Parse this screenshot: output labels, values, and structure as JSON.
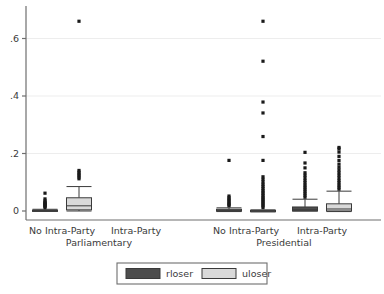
{
  "chart_data": {
    "type": "box",
    "title": "",
    "xlabel": "",
    "ylabel": "",
    "ylim": [
      -0.02,
      0.69
    ],
    "yticks": [
      0,
      0.2,
      0.4,
      0.6
    ],
    "ytick_labels": [
      "0",
      ".2",
      ".4",
      ".6"
    ],
    "grid": true,
    "grid_axis": "y",
    "legend": {
      "position": "bottom-center",
      "entries": [
        {
          "name": "rloser",
          "color": "#4d4d4d"
        },
        {
          "name": "uloser",
          "color": "#d9d9d9"
        }
      ]
    },
    "group_labels": [
      "Parliamentary",
      "Presidential"
    ],
    "categories": [
      "No Intra-Party",
      "Intra-Party",
      "No Intra-Party",
      "Intra-Party"
    ],
    "groups": [
      {
        "group": "Parliamentary",
        "category": "No Intra-Party",
        "boxes": [
          {
            "series": "rloser",
            "present": true,
            "min": 0.0,
            "q1": 0.0,
            "median": 0.0,
            "q3": 0.003,
            "max": 0.006,
            "outliers": [
              0.012,
              0.016,
              0.019,
              0.022,
              0.025,
              0.028,
              0.031,
              0.035,
              0.042,
              0.062
            ]
          },
          {
            "series": "uloser",
            "present": true,
            "min": 0.0,
            "q1": 0.004,
            "median": 0.018,
            "q3": 0.046,
            "max": 0.085,
            "outliers": [
              0.112,
              0.118,
              0.124,
              0.129,
              0.135,
              0.141,
              0.66
            ]
          }
        ]
      },
      {
        "group": "Parliamentary",
        "category": "Intra-Party",
        "boxes": [
          {
            "series": "rloser",
            "present": false,
            "outliers": []
          },
          {
            "series": "uloser",
            "present": false,
            "outliers": []
          }
        ]
      },
      {
        "group": "Presidential",
        "category": "No Intra-Party",
        "boxes": [
          {
            "series": "rloser",
            "present": true,
            "min": -0.002,
            "q1": 0.0,
            "median": 0.0,
            "q3": 0.006,
            "max": 0.011,
            "outliers": [
              0.018,
              0.022,
              0.026,
              0.031,
              0.036,
              0.041,
              0.046,
              0.052,
              0.176
            ]
          },
          {
            "series": "uloser",
            "present": true,
            "min": -0.003,
            "q1": 0.0,
            "median": 0.0,
            "q3": 0.002,
            "max": 0.004,
            "outliers": [
              0.012,
              0.018,
              0.023,
              0.028,
              0.033,
              0.038,
              0.043,
              0.048,
              0.054,
              0.06,
              0.066,
              0.072,
              0.079,
              0.086,
              0.093,
              0.101,
              0.11,
              0.119,
              0.176,
              0.259,
              0.341,
              0.379,
              0.521,
              0.66
            ]
          }
        ]
      },
      {
        "group": "Presidential",
        "category": "Intra-Party",
        "boxes": [
          {
            "series": "rloser",
            "present": true,
            "min": 0.0,
            "q1": 0.0,
            "median": 0.004,
            "q3": 0.014,
            "max": 0.041,
            "outliers": [
              0.048,
              0.055,
              0.062,
              0.069,
              0.076,
              0.083,
              0.09,
              0.098,
              0.106,
              0.115,
              0.124,
              0.133,
              0.15,
              0.167,
              0.204
            ]
          },
          {
            "series": "uloser",
            "present": true,
            "min": -0.002,
            "q1": 0.0,
            "median": 0.007,
            "q3": 0.025,
            "max": 0.069,
            "outliers": [
              0.076,
              0.083,
              0.09,
              0.098,
              0.106,
              0.115,
              0.124,
              0.133,
              0.142,
              0.152,
              0.163,
              0.176,
              0.19,
              0.205,
              0.216,
              0.221
            ]
          }
        ]
      }
    ]
  },
  "style": {
    "rloser_fill": "#4d4d4d",
    "uloser_fill": "#d9d9d9",
    "box_stroke": "#3a3a3a",
    "grid_color": "#ededed",
    "axis_color": "#6e6e6e",
    "marker_color": "#1a1a1a",
    "legend_border": "#6e6e6e",
    "background": "#ffffff"
  }
}
